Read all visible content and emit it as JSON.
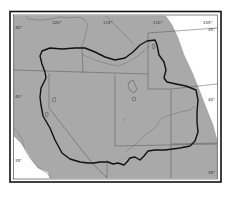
{
  "map": {
    "title": "",
    "colors": {
      "land": "#a9a9a9",
      "water": "#ffffff",
      "boundary": "#1a1a1a",
      "state_lines": "#555555",
      "rivers": "#777777",
      "frame": "#111111"
    },
    "graticule_labels": {
      "top": [
        "120°",
        "115°",
        "110°",
        "105°"
      ],
      "left": [
        "40°",
        "35°"
      ],
      "right": [
        "45°",
        "40°",
        "35°"
      ],
      "bottom": [
        "115°",
        "110°"
      ]
    },
    "features": {
      "outline": "study-area-boundary",
      "lakes": [
        "great-salt-lake",
        "utah-lake",
        "lake-tahoe",
        "pyramid-lake"
      ]
    }
  }
}
